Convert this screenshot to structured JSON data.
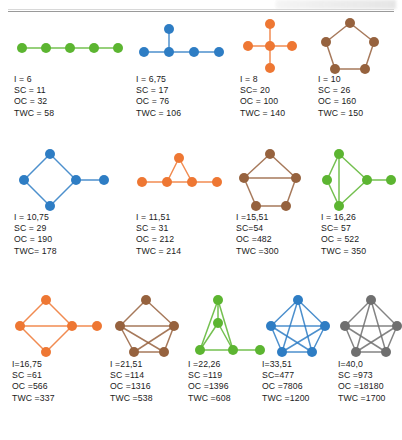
{
  "figure": {
    "width": 402,
    "height": 440,
    "background": "#ffffff",
    "rule_color": "#9a9a9a"
  },
  "palette": {
    "green": "#5cb531",
    "blue": "#2e7dc4",
    "orange": "#ee7733",
    "brown": "#96623e",
    "gray": "#6f6f6f",
    "edge_opacity": "0.85"
  },
  "rows": [
    {
      "y": 18,
      "label_y": 72,
      "cells": [
        {
          "x": 14,
          "w": 120,
          "color_name": "green",
          "color": "#5cb531",
          "graph_name": "path-graph-5",
          "lines": [
            "I = 6",
            "SC = 11",
            "OC = 32",
            "TWC = 58"
          ],
          "metrics": {
            "I": "6",
            "SC": "11",
            "OC": "32",
            "TWC": "58"
          },
          "nodes": [
            [
              8,
              30
            ],
            [
              32,
              30
            ],
            [
              56,
              30
            ],
            [
              80,
              30
            ],
            [
              104,
              30
            ]
          ],
          "edges": [
            [
              0,
              1
            ],
            [
              1,
              2
            ],
            [
              2,
              3
            ],
            [
              3,
              4
            ]
          ]
        },
        {
          "x": 136,
          "w": 100,
          "color_name": "blue",
          "color": "#2e7dc4",
          "graph_name": "tree-graph-5",
          "lines": [
            "I = 6,75",
            "SC = 17",
            "OC = 76",
            "TWC = 106"
          ],
          "metrics": {
            "I": "6,75",
            "SC": "17",
            "OC": "76",
            "TWC": "106"
          },
          "nodes": [
            [
              8,
              34
            ],
            [
              33,
              34
            ],
            [
              58,
              34
            ],
            [
              83,
              34
            ],
            [
              33,
              11
            ]
          ],
          "edges": [
            [
              0,
              1
            ],
            [
              1,
              2
            ],
            [
              2,
              3
            ],
            [
              1,
              4
            ]
          ]
        },
        {
          "x": 240,
          "w": 80,
          "color_name": "orange",
          "color": "#ee7733",
          "graph_name": "star-graph-5",
          "lines": [
            "I = 8",
            "SC= 20",
            "OC = 100",
            "TWC = 140"
          ],
          "metrics": {
            "I": "8",
            "SC": "20",
            "OC": "100",
            "TWC": "140"
          },
          "nodes": [
            [
              30,
              28
            ],
            [
              8,
              28
            ],
            [
              52,
              28
            ],
            [
              30,
              6
            ],
            [
              30,
              50
            ]
          ],
          "edges": [
            [
              0,
              1
            ],
            [
              0,
              2
            ],
            [
              0,
              3
            ],
            [
              0,
              4
            ]
          ]
        },
        {
          "x": 318,
          "w": 80,
          "color_name": "brown",
          "color": "#96623e",
          "graph_name": "cycle-graph-5",
          "lines": [
            "I = 10",
            "SC = 26",
            "OC = 160",
            "TWC = 150"
          ],
          "metrics": {
            "I": "10",
            "SC": "26",
            "OC": "160",
            "TWC": "150"
          },
          "nodes": [
            [
              32,
              5
            ],
            [
              8,
              24
            ],
            [
              17,
              51
            ],
            [
              47,
              51
            ],
            [
              56,
              24
            ]
          ],
          "edges": [
            [
              0,
              1
            ],
            [
              1,
              2
            ],
            [
              2,
              3
            ],
            [
              3,
              4
            ],
            [
              4,
              0
            ]
          ]
        }
      ]
    },
    {
      "y": 148,
      "label_y": 210,
      "cells": [
        {
          "x": 14,
          "w": 120,
          "color_name": "blue",
          "color": "#2e7dc4",
          "graph_name": "cycle4-pendant-graph",
          "lines": [
            "I = 10,75",
            "SC = 29",
            "OC = 190",
            "TWC= 178"
          ],
          "metrics": {
            "I": "10,75",
            "SC": "29",
            "OC": "190",
            "TWC": "178"
          },
          "nodes": [
            [
              36,
              6
            ],
            [
              10,
              32
            ],
            [
              36,
              58
            ],
            [
              62,
              32
            ],
            [
              90,
              32
            ]
          ],
          "edges": [
            [
              0,
              1
            ],
            [
              1,
              2
            ],
            [
              2,
              3
            ],
            [
              3,
              0
            ],
            [
              3,
              4
            ]
          ]
        },
        {
          "x": 136,
          "w": 100,
          "color_name": "orange",
          "color": "#ee7733",
          "graph_name": "triangle-path-graph",
          "lines": [
            "I = 11,51",
            "SC = 31",
            "OC = 212",
            "TWC = 214"
          ],
          "metrics": {
            "I": "11,51",
            "SC": "31",
            "OC": "212",
            "TWC": "214"
          },
          "nodes": [
            [
              6,
              34
            ],
            [
              31,
              34
            ],
            [
              56,
              34
            ],
            [
              81,
              34
            ],
            [
              43,
              10
            ]
          ],
          "edges": [
            [
              0,
              1
            ],
            [
              1,
              2
            ],
            [
              2,
              3
            ],
            [
              1,
              4
            ],
            [
              2,
              4
            ]
          ]
        },
        {
          "x": 236,
          "w": 85,
          "color_name": "brown",
          "color": "#96623e",
          "graph_name": "cycle5-chord-graph",
          "lines": [
            "I =15,51",
            "SC=54",
            "OC =482",
            "TWC =300"
          ],
          "metrics": {
            "I": "15,51",
            "SC": "54",
            "OC": "482",
            "TWC": "300"
          },
          "nodes": [
            [
              34,
              6
            ],
            [
              8,
              30
            ],
            [
              20,
              58
            ],
            [
              50,
              58
            ],
            [
              60,
              30
            ]
          ],
          "edges": [
            [
              0,
              1
            ],
            [
              1,
              2
            ],
            [
              2,
              3
            ],
            [
              3,
              4
            ],
            [
              4,
              0
            ],
            [
              1,
              4
            ]
          ]
        },
        {
          "x": 321,
          "w": 80,
          "color_name": "green",
          "color": "#5cb531",
          "graph_name": "diamond-chord-pendant-graph",
          "lines": [
            "I = 16,26",
            "SC= 57",
            "OC = 522",
            "TWC = 350"
          ],
          "metrics": {
            "I": "16,26",
            "SC": "57",
            "OC": "522",
            "TWC": "350"
          },
          "nodes": [
            [
              18,
              6
            ],
            [
              18,
              58
            ],
            [
              46,
              32
            ],
            [
              70,
              32
            ],
            [
              6,
              32
            ]
          ],
          "edges": [
            [
              0,
              1
            ],
            [
              0,
              2
            ],
            [
              1,
              2
            ],
            [
              2,
              3
            ],
            [
              0,
              4
            ],
            [
              1,
              4
            ]
          ]
        }
      ]
    },
    {
      "y": 295,
      "label_y": 357,
      "cells": [
        {
          "x": 12,
          "w": 100,
          "color_name": "orange",
          "color": "#ee7733",
          "graph_name": "diamond-chord-pendant-graph-orange",
          "lines": [
            "I=16,75",
            "SC =61",
            "OC =566",
            "TWC =337"
          ],
          "metrics": {
            "I": "16,75",
            "SC": "61",
            "OC": "566",
            "TWC": "337"
          },
          "nodes": [
            [
              34,
              5
            ],
            [
              8,
              31
            ],
            [
              34,
              57
            ],
            [
              60,
              31
            ],
            [
              85,
              31
            ]
          ],
          "edges": [
            [
              0,
              1
            ],
            [
              1,
              2
            ],
            [
              2,
              3
            ],
            [
              3,
              0
            ],
            [
              1,
              3
            ],
            [
              3,
              4
            ]
          ]
        },
        {
          "x": 110,
          "w": 100,
          "color_name": "brown",
          "color": "#96623e",
          "graph_name": "cycle5-multi-chord-graph",
          "lines": [
            "I =21,51",
            "SC =114",
            "OC =1316",
            "TWC =538"
          ],
          "metrics": {
            "I": "21,51",
            "SC": "114",
            "OC": "1316",
            "TWC": "538"
          },
          "nodes": [
            [
              36,
              5
            ],
            [
              10,
              31
            ],
            [
              24,
              57
            ],
            [
              54,
              57
            ],
            [
              64,
              31
            ]
          ],
          "edges": [
            [
              0,
              1
            ],
            [
              1,
              2
            ],
            [
              2,
              3
            ],
            [
              3,
              4
            ],
            [
              4,
              0
            ],
            [
              1,
              4
            ],
            [
              1,
              3
            ],
            [
              2,
              4
            ]
          ]
        },
        {
          "x": 188,
          "w": 90,
          "color_name": "green",
          "color": "#5cb531",
          "graph_name": "triangle-stack-path-graph",
          "lines": [
            "I =22,26",
            "SC =119",
            "OC =1396",
            "TWC =608",
            "TWC2"
          ],
          "metrics": {
            "I": "22,26",
            "SC": "119",
            "OC": "1396",
            "TWC": "608"
          },
          "nodes": [
            [
              30,
              5
            ],
            [
              30,
              28
            ],
            [
              12,
              55
            ],
            [
              45,
              55
            ],
            [
              72,
              55
            ]
          ],
          "edges": [
            [
              0,
              1
            ],
            [
              0,
              2
            ],
            [
              0,
              3
            ],
            [
              1,
              2
            ],
            [
              1,
              3
            ],
            [
              2,
              3
            ],
            [
              3,
              4
            ]
          ]
        },
        {
          "x": 262,
          "w": 90,
          "color_name": "blue",
          "color": "#2e7dc4",
          "graph_name": "near-complete-graph-5",
          "lines": [
            "I=33,51",
            "SC=477",
            "OC =7806",
            "TWC =1200"
          ],
          "metrics": {
            "I": "33,51",
            "SC": "477",
            "OC": "7806",
            "TWC": "1200"
          },
          "nodes": [
            [
              36,
              5
            ],
            [
              9,
              31
            ],
            [
              20,
              57
            ],
            [
              50,
              57
            ],
            [
              63,
              31
            ]
          ],
          "edges": [
            [
              0,
              1
            ],
            [
              1,
              2
            ],
            [
              2,
              3
            ],
            [
              3,
              4
            ],
            [
              4,
              0
            ],
            [
              0,
              2
            ],
            [
              0,
              3
            ],
            [
              1,
              3
            ],
            [
              1,
              4
            ],
            [
              2,
              4
            ]
          ]
        },
        {
          "x": 338,
          "w": 80,
          "color_name": "gray",
          "color": "#6f6f6f",
          "graph_name": "complete-graph-5",
          "lines": [
            "I=40,0",
            "SC =973",
            "OC =18180",
            "TWC =1700"
          ],
          "metrics": {
            "I": "40,0",
            "SC": "973",
            "OC": "18180",
            "TWC": "1700"
          },
          "nodes": [
            [
              33,
              5
            ],
            [
              7,
              31
            ],
            [
              18,
              57
            ],
            [
              48,
              57
            ],
            [
              59,
              31
            ]
          ],
          "edges": [
            [
              0,
              1
            ],
            [
              1,
              2
            ],
            [
              2,
              3
            ],
            [
              3,
              4
            ],
            [
              4,
              0
            ],
            [
              0,
              2
            ],
            [
              0,
              3
            ],
            [
              1,
              3
            ],
            [
              1,
              4
            ],
            [
              2,
              4
            ]
          ]
        }
      ]
    }
  ],
  "chart_data": {
    "type": "table",
    "title": "",
    "columns": [
      "Graph",
      "I",
      "SC",
      "OC",
      "TWC"
    ],
    "rows": [
      {
        "graph": "path-graph-5",
        "color": "green",
        "I": "6",
        "SC": "11",
        "OC": "32",
        "TWC": "58"
      },
      {
        "graph": "tree-graph-5",
        "color": "blue",
        "I": "6,75",
        "SC": "17",
        "OC": "76",
        "TWC": "106"
      },
      {
        "graph": "star-graph-5",
        "color": "orange",
        "I": "8",
        "SC": "20",
        "OC": "100",
        "TWC": "140"
      },
      {
        "graph": "cycle-graph-5",
        "color": "brown",
        "I": "10",
        "SC": "26",
        "OC": "160",
        "TWC": "150"
      },
      {
        "graph": "cycle4-pendant-graph",
        "color": "blue",
        "I": "10,75",
        "SC": "29",
        "OC": "190",
        "TWC": "178"
      },
      {
        "graph": "triangle-path-graph",
        "color": "orange",
        "I": "11,51",
        "SC": "31",
        "OC": "212",
        "TWC": "214"
      },
      {
        "graph": "cycle5-chord-graph",
        "color": "brown",
        "I": "15,51",
        "SC": "54",
        "OC": "482",
        "TWC": "300"
      },
      {
        "graph": "diamond-chord-pendant-graph",
        "color": "green",
        "I": "16,26",
        "SC": "57",
        "OC": "522",
        "TWC": "350"
      },
      {
        "graph": "diamond-chord-pendant-graph-orange",
        "color": "orange",
        "I": "16,75",
        "SC": "61",
        "OC": "566",
        "TWC": "337"
      },
      {
        "graph": "cycle5-multi-chord-graph",
        "color": "brown",
        "I": "21,51",
        "SC": "114",
        "OC": "1316",
        "TWC": "538"
      },
      {
        "graph": "triangle-stack-path-graph",
        "color": "green",
        "I": "22,26",
        "SC": "119",
        "OC": "1396",
        "TWC": "608"
      },
      {
        "graph": "near-complete-graph-5",
        "color": "blue",
        "I": "33,51",
        "SC": "477",
        "OC": "7806",
        "TWC": "1200"
      },
      {
        "graph": "complete-graph-5",
        "color": "gray",
        "I": "40,0",
        "SC": "973",
        "OC": "18180",
        "TWC": "1700"
      }
    ]
  }
}
